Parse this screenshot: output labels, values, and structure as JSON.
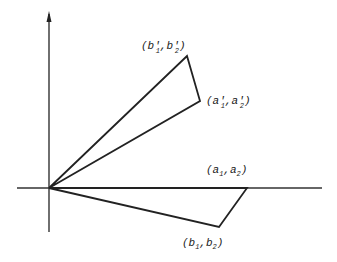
{
  "diagram": {
    "type": "vector-parallelogram-figure",
    "axes": {
      "origin": [
        49,
        188
      ],
      "x_axis": {
        "from": [
          17,
          188
        ],
        "to": [
          322,
          188
        ]
      },
      "y_axis": {
        "from": [
          49,
          232
        ],
        "to": [
          49,
          12
        ],
        "arrow": true
      }
    },
    "stroke_color": "#222222",
    "points": {
      "b_prime": {
        "pos": [
          187,
          56
        ],
        "label": "(b′₁,b′₂)",
        "base1": "(b",
        "sub1": "1",
        "mid": ",b",
        "sub2": "2",
        "end": ")",
        "prime": "′"
      },
      "a_prime": {
        "pos": [
          200,
          101
        ],
        "label": "(a′₁,a′₂)",
        "base1": "(a",
        "sub1": "1",
        "mid": ",a",
        "sub2": "2",
        "end": ")",
        "prime": "′"
      },
      "a": {
        "pos": [
          247,
          188
        ],
        "label": "(a₁,a₂)",
        "base1": "(a",
        "sub1": "1",
        "mid": ",a",
        "sub2": "2",
        "end": ")"
      },
      "b": {
        "pos": [
          219,
          227
        ],
        "label": "(b₁,b₂)",
        "base1": "(b",
        "sub1": "1",
        "mid": ",b",
        "sub2": "2",
        "end": ")"
      }
    }
  }
}
